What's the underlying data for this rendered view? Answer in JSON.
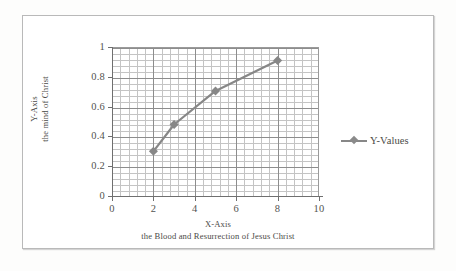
{
  "chart_data": {
    "type": "line",
    "title": "",
    "xlabel": "X-Axis",
    "xlabel_sub": "the Blood and Resurrection of Jesus Christ",
    "ylabel": "Y-Axis",
    "ylabel_sub": "the mind of Christ",
    "xlim": [
      0,
      10
    ],
    "ylim": [
      0,
      1
    ],
    "x_ticks": [
      "0",
      "2",
      "4",
      "6",
      "8",
      "10"
    ],
    "y_ticks": [
      "0",
      "0.2",
      "0.4",
      "0.6",
      "0.8",
      "1"
    ],
    "x_major_step": 2,
    "y_major_step": 0.2,
    "x_minor_step": 0.4,
    "y_minor_step": 0.04,
    "grid": "major-and-minor",
    "legend_position": "right",
    "series": [
      {
        "name": "Y-Values",
        "marker": "diamond",
        "color": "#878787",
        "x": [
          2,
          3,
          5,
          8
        ],
        "values": [
          0.3,
          0.48,
          0.705,
          0.91
        ]
      }
    ]
  },
  "legend": {
    "entries": [
      {
        "label": "Y-Values",
        "color": "#878787"
      }
    ]
  },
  "axes": {
    "x": {
      "title": "X-Axis",
      "subtitle": "the Blood and Resurrection of Jesus Christ",
      "ticks": [
        "0",
        "2",
        "4",
        "6",
        "8",
        "10"
      ]
    },
    "y": {
      "title": "Y-Axis",
      "subtitle": "the mind of Christ",
      "ticks": [
        "0",
        "0.2",
        "0.4",
        "0.6",
        "0.8",
        "1"
      ]
    }
  },
  "colors": {
    "series": "#878787",
    "major_grid": "#8d8d8d",
    "minor_grid": "#c4c4c4",
    "frame": "#b9b9b9",
    "text": "#4b4b47"
  }
}
